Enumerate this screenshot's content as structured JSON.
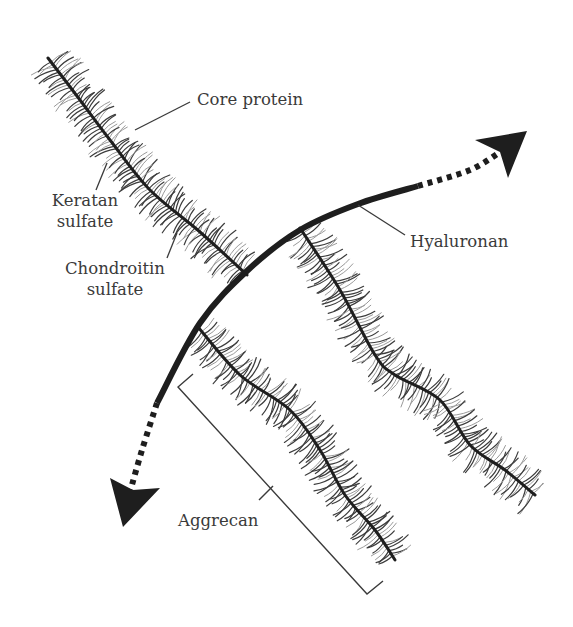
{
  "figure": {
    "labels": {
      "core_protein": "Core protein",
      "keratan_sulfate_line1": "Keratan",
      "keratan_sulfate_line2": "sulfate",
      "chondroitin_sulfate_line1": "Chondroitin",
      "chondroitin_sulfate_line2": "sulfate",
      "hyaluronan": "Hyaluronan",
      "aggrecan": "Aggrecan"
    },
    "colors": {
      "ink": "#1e1e1e",
      "bristle_dark": "#3c3c3c",
      "bristle_light": "#9a9a9a",
      "text": "#3a3a3a",
      "background": "#ffffff"
    },
    "hyaluronan_path": {
      "solid": [
        [
          157,
          403
        ],
        [
          200,
          323
        ],
        [
          248,
          270
        ],
        [
          300,
          230
        ],
        [
          358,
          204
        ],
        [
          418,
          186
        ]
      ],
      "dotted_top_end": [
        [
          418,
          186
        ],
        [
          470,
          170
        ],
        [
          503,
          150
        ]
      ],
      "dotted_bottom_end": [
        [
          157,
          403
        ],
        [
          142,
          450
        ],
        [
          130,
          492
        ]
      ],
      "arrow_top": {
        "tip": [
          527,
          131
        ],
        "wing1": [
          475,
          140
        ],
        "wing2": [
          508,
          178
        ],
        "notch": [
          500,
          152
        ]
      },
      "arrow_bottom": {
        "tip": [
          123,
          527
        ],
        "wing1": [
          110,
          478
        ],
        "wing2": [
          160,
          488
        ],
        "notch": [
          133,
          490
        ]
      }
    },
    "aggrecan_strands": [
      {
        "name": "strand-1",
        "core": [
          [
            247,
            275
          ],
          [
            200,
            232
          ],
          [
            150,
            190
          ],
          [
            110,
            140
          ],
          [
            80,
            100
          ],
          [
            48,
            58
          ]
        ]
      },
      {
        "name": "strand-2",
        "core": [
          [
            300,
            228
          ],
          [
            340,
            290
          ],
          [
            375,
            355
          ],
          [
            395,
            375
          ],
          [
            440,
            400
          ],
          [
            470,
            445
          ],
          [
            505,
            470
          ],
          [
            535,
            495
          ]
        ]
      },
      {
        "name": "strand-3",
        "core": [
          [
            198,
            327
          ],
          [
            240,
            375
          ],
          [
            290,
            410
          ],
          [
            320,
            450
          ],
          [
            345,
            495
          ],
          [
            375,
            530
          ],
          [
            395,
            560
          ]
        ]
      }
    ],
    "bracket": {
      "arm_top": [
        193,
        374
      ],
      "corner_top": [
        178,
        387
      ],
      "corner_bottom": [
        367,
        594
      ],
      "arm_bottom": [
        383,
        581
      ],
      "tick_from": [
        273,
        486
      ],
      "tick_to": [
        259,
        500
      ]
    }
  }
}
